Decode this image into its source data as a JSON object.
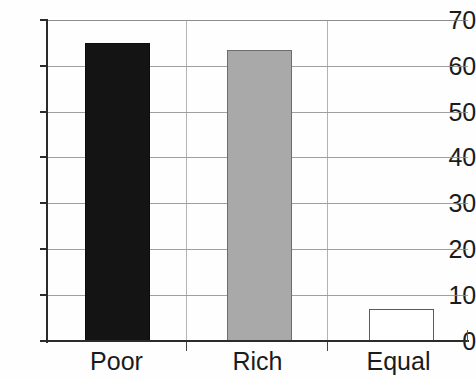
{
  "chart_data": {
    "type": "bar",
    "title": "",
    "subtitle": "",
    "xlabel": "",
    "ylabel": "",
    "categories": [
      "Poor",
      "Rich",
      "Equal"
    ],
    "values": [
      65,
      63.5,
      7
    ],
    "series": [
      {
        "name": "",
        "values": [
          65,
          63.5,
          7
        ]
      }
    ],
    "ylim": [
      0,
      70
    ],
    "y_ticks": [
      0,
      10,
      20,
      30,
      40,
      50,
      60,
      70
    ],
    "y_tick_labels": [
      "0",
      "10",
      "20",
      "30",
      "40",
      "50",
      "60",
      "70"
    ],
    "grid": true,
    "grid_axis": "y",
    "legend": false,
    "legend_position": "none",
    "bar_colors": [
      "#141414",
      "#a9a9a9",
      "#ffffff"
    ],
    "bar_edge_colors": [
      "#0c0c0c",
      "#6d6d6d",
      "#5a5a5a"
    ],
    "axis_color": "#2b2b2b",
    "gridline_color": "#8e8e8e",
    "background_color": "#fefefe",
    "text_color": "#1b1b1b"
  }
}
